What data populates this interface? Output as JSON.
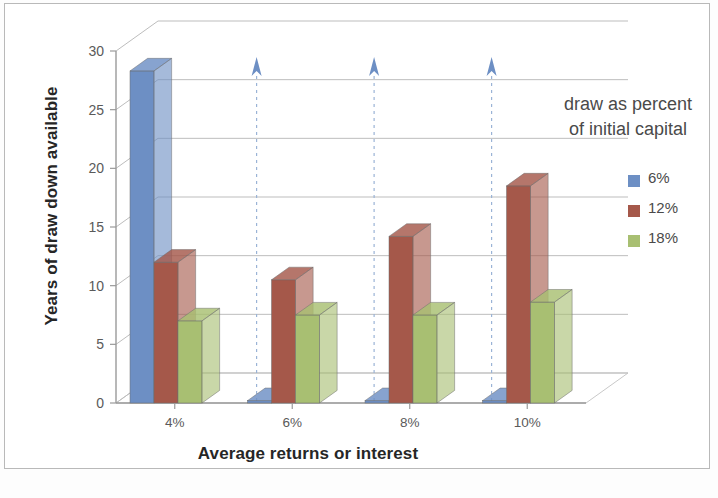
{
  "chart_data": {
    "type": "bar",
    "title": "",
    "subtitle": "",
    "xlabel": "Average returns or interest",
    "ylabel": "Years of draw down available",
    "categories": [
      "4%",
      "6%",
      "8%",
      "10%"
    ],
    "series": [
      {
        "name": "6%",
        "color": "#6d8fc4",
        "values": [
          28.3,
          0.2,
          0.2,
          0.2
        ]
      },
      {
        "name": "12%",
        "color": "#a5584a",
        "values": [
          12.0,
          10.5,
          14.2,
          18.5
        ]
      },
      {
        "name": "18%",
        "color": "#a8bf72",
        "values": [
          7.0,
          7.5,
          7.5,
          8.6
        ]
      }
    ],
    "yticks": [
      0,
      5,
      10,
      15,
      20,
      25,
      30
    ],
    "ylim": [
      0,
      30
    ],
    "grid": true,
    "legend_title": "draw as percent of initial capital",
    "legend_position": "right",
    "annotations": [
      {
        "type": "arrow-up",
        "category": "6%",
        "color": "#6d8fc4"
      },
      {
        "type": "arrow-up",
        "category": "8%",
        "color": "#6d8fc4"
      },
      {
        "type": "arrow-up",
        "category": "10%",
        "color": "#6d8fc4"
      }
    ]
  },
  "axis": {
    "y_title": "Years of draw down available",
    "x_title": "Average returns or interest",
    "y_tick_labels": [
      "30",
      "25",
      "20",
      "15",
      "10",
      "5",
      "0"
    ],
    "x_tick_labels": [
      "4%",
      "6%",
      "8%",
      "10%"
    ]
  },
  "legend": {
    "title_line1": "draw as percent",
    "title_line2": "of initial capital",
    "items": [
      {
        "label": "6%",
        "color": "#6d8fc4"
      },
      {
        "label": "12%",
        "color": "#a5584a"
      },
      {
        "label": "18%",
        "color": "#a8bf72"
      }
    ]
  }
}
